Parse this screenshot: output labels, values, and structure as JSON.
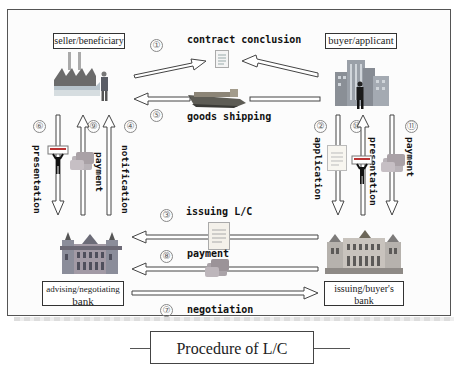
{
  "diagram": {
    "title": "Procedure of L/C",
    "parties": {
      "seller": "seller/beneficiary",
      "buyer": "buyer/applicant",
      "advising_bank_line1": "advising/negotiating",
      "advising_bank_line2": "bank",
      "issuing_bank_line1": "issuing/buyer's",
      "issuing_bank_line2": "bank"
    },
    "steps": [
      {
        "num": "1",
        "label": "contract conclusion",
        "from": "seller/buyer",
        "to": "contract"
      },
      {
        "num": "2",
        "label": "application",
        "from": "buyer/applicant",
        "to": "issuing/buyer's bank"
      },
      {
        "num": "3",
        "label": "issuing L/C",
        "from": "issuing/buyer's bank",
        "to": "advising/negotiating bank"
      },
      {
        "num": "4",
        "label": "notification",
        "from": "advising/negotiating bank",
        "to": "seller/beneficiary"
      },
      {
        "num": "5",
        "label": "goods shipping",
        "from": "buyer side",
        "to": "seller/beneficiary"
      },
      {
        "num": "6",
        "label": "presentation",
        "from": "seller/beneficiary",
        "to": "advising/negotiating bank"
      },
      {
        "num": "7",
        "label": "negotiation",
        "from": "advising/negotiating bank",
        "to": "issuing/buyer's bank"
      },
      {
        "num": "8",
        "label": "payment",
        "from": "issuing/buyer's bank",
        "to": "advising/negotiating bank"
      },
      {
        "num": "9",
        "label": "payment",
        "from": "advising/negotiating bank",
        "to": "seller/beneficiary"
      },
      {
        "num": "10",
        "label": "presentation",
        "from": "issuing/buyer's bank",
        "to": "buyer/applicant"
      },
      {
        "num": "11",
        "label": "payment",
        "from": "buyer/applicant",
        "to": "issuing/buyer's bank"
      }
    ],
    "circled": {
      "n1": "①",
      "n2": "②",
      "n3": "③",
      "n4": "④",
      "n5": "⑤",
      "n6": "⑥",
      "n7": "⑦",
      "n8": "⑧",
      "n9": "⑨",
      "n10": "⑩",
      "n11": "⑪"
    },
    "icons": {
      "seller": "factory-with-businessman-icon",
      "buyer": "office-buildings-with-businessman-icon",
      "advising_bank": "bank-building-icon",
      "issuing_bank": "bank-building-icon",
      "contract": "document-icon",
      "shipping": "cargo-ship-icon",
      "lc": "document-icon",
      "money": "money-stack-icon",
      "presenter": "person-holding-sign-icon"
    }
  }
}
